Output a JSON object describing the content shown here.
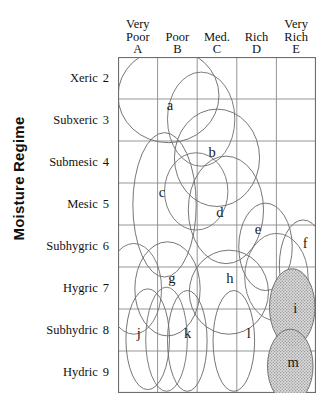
{
  "axes": {
    "y_title": "Moisture Regime",
    "x_title": "Nutrient Regime"
  },
  "columns": [
    {
      "name": "Very Poor",
      "line1": "Very",
      "line2": "Poor",
      "code": "A"
    },
    {
      "name": "Poor",
      "line1": "",
      "line2": "Poor",
      "code": "B"
    },
    {
      "name": "Med.",
      "line1": "",
      "line2": "Med.",
      "code": "C"
    },
    {
      "name": "Rich",
      "line1": "",
      "line2": "Rich",
      "code": "D"
    },
    {
      "name": "Very Rich",
      "line1": "Very",
      "line2": "Rich",
      "code": "E"
    }
  ],
  "rows": [
    {
      "label": "Xeric",
      "num": "2"
    },
    {
      "label": "Subxeric",
      "num": "3"
    },
    {
      "label": "Submesic",
      "num": "4"
    },
    {
      "label": "Mesic",
      "num": "5"
    },
    {
      "label": "Subhygric",
      "num": "6"
    },
    {
      "label": "Hygric",
      "num": "7"
    },
    {
      "label": "Subhydric",
      "num": "8"
    },
    {
      "label": "Hydric",
      "num": "9"
    }
  ],
  "style": {
    "grid_line_color": "#8a8a8a",
    "grid_border_color": "#6e6e6e",
    "ellipse_stroke": "#6f6f6f",
    "shaded_fill": "#c9c9c9",
    "background": "#ffffff"
  },
  "chart_data": {
    "type": "scatter",
    "title": "",
    "xlabel": "Nutrient Regime",
    "ylabel": "Moisture Regime",
    "grid": true,
    "legend": "none",
    "x_categories": [
      "Very Poor A",
      "Poor B",
      "Med. C",
      "Rich D",
      "Very Rich E"
    ],
    "y_categories": [
      "Xeric 2",
      "Subxeric 3",
      "Submesic 4",
      "Mesic 5",
      "Subhygric 6",
      "Hygric 7",
      "Subhydric 8",
      "Hydric 9"
    ],
    "note": "Edatopic grid: 13 lettered ellipses (a-m) drawn as site-unit envelopes over a 5-column x 8-row nutrient/moisture grid. Ellipse 'i' is shaded.",
    "ellipses": [
      {
        "id": "a",
        "cx": 0.255,
        "cy": 0.115,
        "rx": 0.255,
        "ry": 0.14,
        "rot": 0,
        "shaded": false,
        "label_x": 0.262,
        "label_y": 0.143
      },
      {
        "id": "b",
        "cx": 0.5,
        "cy": 0.3,
        "rx": 0.215,
        "ry": 0.145,
        "rot": 0,
        "shaded": false,
        "label_x": 0.475,
        "label_y": 0.283
      },
      {
        "id": "c",
        "cx": 0.235,
        "cy": 0.44,
        "rx": 0.16,
        "ry": 0.215,
        "rot": 0,
        "shaded": false,
        "label_x": 0.222,
        "label_y": 0.402
      },
      {
        "id": "d",
        "cx": 0.545,
        "cy": 0.455,
        "rx": 0.19,
        "ry": 0.16,
        "rot": 0,
        "shaded": false,
        "label_x": 0.515,
        "label_y": 0.462
      },
      {
        "id": "e",
        "cx": 0.745,
        "cy": 0.565,
        "rx": 0.135,
        "ry": 0.13,
        "rot": 0,
        "shaded": false,
        "label_x": 0.707,
        "label_y": 0.512
      },
      {
        "id": "f",
        "cx": 0.935,
        "cy": 0.62,
        "rx": 0.12,
        "ry": 0.135,
        "rot": 0,
        "shaded": false,
        "label_x": 0.945,
        "label_y": 0.554
      },
      {
        "id": "g",
        "cx": 0.25,
        "cy": 0.69,
        "rx": 0.165,
        "ry": 0.14,
        "rot": 0,
        "shaded": false,
        "label_x": 0.272,
        "label_y": 0.658
      },
      {
        "id": "h",
        "cx": 0.56,
        "cy": 0.7,
        "rx": 0.2,
        "ry": 0.125,
        "rot": 0,
        "shaded": false,
        "label_x": 0.565,
        "label_y": 0.658
      },
      {
        "id": "i",
        "cx": 0.88,
        "cy": 0.745,
        "rx": 0.115,
        "ry": 0.115,
        "rot": 0,
        "shaded": true,
        "label_x": 0.895,
        "label_y": 0.747
      },
      {
        "id": "j",
        "cx": 0.15,
        "cy": 0.84,
        "rx": 0.11,
        "ry": 0.15,
        "rot": 0,
        "shaded": false,
        "label_x": 0.105,
        "label_y": 0.822
      },
      {
        "id": "k",
        "cx": 0.35,
        "cy": 0.845,
        "rx": 0.1,
        "ry": 0.15,
        "rot": 0,
        "shaded": false,
        "label_x": 0.352,
        "label_y": 0.822
      },
      {
        "id": "l",
        "cx": 0.585,
        "cy": 0.845,
        "rx": 0.105,
        "ry": 0.15,
        "rot": 0,
        "shaded": false,
        "label_x": 0.66,
        "label_y": 0.822
      },
      {
        "id": "m",
        "cx": 0.87,
        "cy": 0.92,
        "rx": 0.115,
        "ry": 0.11,
        "rot": 0,
        "shaded": true,
        "label_x": 0.885,
        "label_y": 0.907
      }
    ],
    "extra_outlines": [
      {
        "cx": 0.42,
        "cy": 0.185,
        "rx": 0.17,
        "ry": 0.14
      },
      {
        "cx": 0.395,
        "cy": 0.4,
        "rx": 0.16,
        "ry": 0.115
      },
      {
        "cx": 0.08,
        "cy": 0.69,
        "rx": 0.14,
        "ry": 0.135
      },
      {
        "cx": 0.8,
        "cy": 0.655,
        "rx": 0.16,
        "ry": 0.13
      },
      {
        "cx": 0.245,
        "cy": 0.84,
        "rx": 0.105,
        "ry": 0.155
      }
    ]
  }
}
